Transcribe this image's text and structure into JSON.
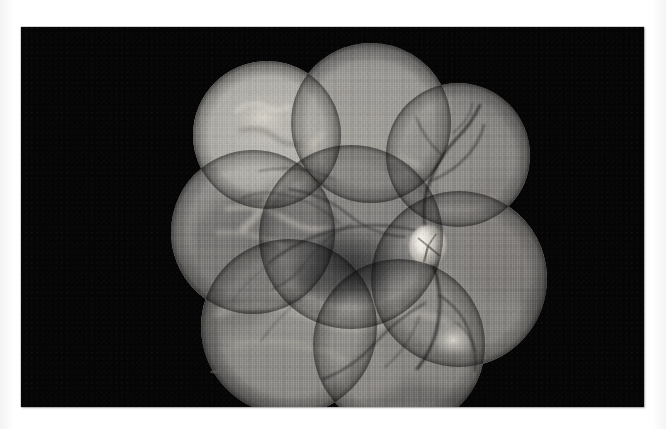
{
  "page": {
    "background_color": "#ffffff"
  },
  "photo": {
    "name": "fundus-montage-print",
    "background_color": "#050505",
    "frame": {
      "x": 21,
      "y": 27,
      "width": 623,
      "height": 380
    },
    "modality": "grayscale fundus photograph montage",
    "caption": ""
  },
  "montage": {
    "description": "Scalloped cloud-shaped composite of overlapping circular fundus camera fields",
    "field_count": 8,
    "fill_base_color": "#8c8c8c",
    "fields": [
      {
        "name": "field-superior-nasal",
        "cx": 246,
        "cy": 108,
        "r": 74
      },
      {
        "name": "field-superior-temporal",
        "cx": 350,
        "cy": 96,
        "r": 80
      },
      {
        "name": "field-superior-far-temporal",
        "cx": 437,
        "cy": 128,
        "r": 72
      },
      {
        "name": "field-mid-nasal",
        "cx": 232,
        "cy": 205,
        "r": 82
      },
      {
        "name": "field-central-macula",
        "cx": 330,
        "cy": 210,
        "r": 92
      },
      {
        "name": "field-optic-disc",
        "cx": 438,
        "cy": 252,
        "r": 88
      },
      {
        "name": "field-inferior-nasal",
        "cx": 268,
        "cy": 300,
        "r": 88
      },
      {
        "name": "field-inferior-temporal",
        "cx": 378,
        "cy": 318,
        "r": 86
      }
    ]
  },
  "features": {
    "optic_disc": {
      "label": "optic-disc",
      "cx": 407,
      "cy": 219,
      "rx": 19,
      "ry": 21,
      "brightness": "#e8e6e0"
    },
    "macula": {
      "label": "macula",
      "cx": 330,
      "cy": 238,
      "rx": 66,
      "ry": 40,
      "brightness": "#4a4a4a"
    },
    "fold_artifact": {
      "label": "retinal-fold-artifact",
      "cx": 242,
      "cy": 92,
      "brightness": "#cfcdc7"
    },
    "bright_lesion_inferior": {
      "label": "bright-lesion-inferior-temporal",
      "cx": 432,
      "cy": 313,
      "brightness": "#d8d6d0"
    },
    "speck": {
      "label": "dust-speck",
      "cx": 193,
      "cy": 345
    }
  },
  "vessels": {
    "color_dark": "#2e2e2e",
    "color_mid": "#545454",
    "count": 14,
    "description": "Branching retinal arterioles and venules radiating from the optic disc"
  }
}
